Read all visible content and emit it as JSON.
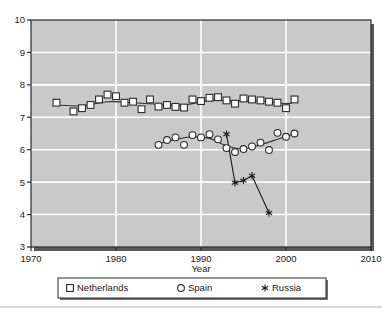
{
  "chart_data": {
    "type": "line",
    "title": "",
    "xlabel": "Year",
    "ylabel": "",
    "xlim": [
      1970,
      2010
    ],
    "ylim": [
      3,
      10
    ],
    "xticks": [
      "1970",
      "1980",
      "1990",
      "2000",
      "2010"
    ],
    "xtick_values": [
      1970,
      1980,
      1990,
      2000,
      2010
    ],
    "yticks": [
      "3",
      "4",
      "5",
      "6",
      "7",
      "8",
      "9",
      "10"
    ],
    "ytick_values": [
      3,
      4,
      5,
      6,
      7,
      8,
      9,
      10
    ],
    "grid": true,
    "grid_color": "#ffffff",
    "plot_bg": "#c9c9c9",
    "legend_position": "below",
    "series": [
      {
        "name": "Netherlands",
        "marker": "square",
        "color": "#333333",
        "x": [
          1973,
          1975,
          1976,
          1977,
          1978,
          1979,
          1980,
          1981,
          1982,
          1983,
          1984,
          1985,
          1986,
          1987,
          1988,
          1989,
          1990,
          1991,
          1992,
          1993,
          1994,
          1995,
          1996,
          1997,
          1998,
          1999,
          2000,
          2001
        ],
        "y": [
          7.45,
          7.18,
          7.28,
          7.38,
          7.55,
          7.7,
          7.65,
          7.45,
          7.48,
          7.25,
          7.55,
          7.33,
          7.38,
          7.32,
          7.3,
          7.55,
          7.5,
          7.6,
          7.62,
          7.52,
          7.42,
          7.58,
          7.55,
          7.52,
          7.48,
          7.45,
          7.28,
          7.55
        ]
      },
      {
        "name": "Spain",
        "marker": "circle",
        "color": "#333333",
        "x": [
          1985,
          1986,
          1987,
          1988,
          1989,
          1990,
          1991,
          1992,
          1993,
          1994,
          1995,
          1996,
          1997,
          1998,
          1999,
          2000,
          2001
        ],
        "y": [
          6.15,
          6.3,
          6.38,
          6.15,
          6.45,
          6.38,
          6.48,
          6.32,
          6.05,
          5.93,
          6.02,
          6.1,
          6.22,
          5.99,
          6.52,
          6.4,
          6.5
        ]
      },
      {
        "name": "Russia",
        "marker": "star",
        "color": "#333333",
        "x": [
          1993,
          1994,
          1995,
          1996,
          1998
        ],
        "y": [
          6.48,
          4.98,
          5.05,
          5.2,
          4.05
        ]
      }
    ],
    "trend_lines": [
      {
        "series": "Netherlands",
        "x": [
          1973,
          1976,
          1979,
          1982,
          1985,
          1988,
          1991,
          1994,
          1997,
          2000,
          2001
        ],
        "y": [
          7.38,
          7.35,
          7.48,
          7.45,
          7.4,
          7.38,
          7.52,
          7.5,
          7.5,
          7.42,
          7.48
        ]
      },
      {
        "series": "Spain",
        "x": [
          1985,
          1987,
          1989,
          1991,
          1993,
          1995,
          1997,
          1999,
          2001
        ],
        "y": [
          6.18,
          6.32,
          6.4,
          6.35,
          6.12,
          6.02,
          6.15,
          6.32,
          6.5
        ]
      }
    ]
  },
  "legend": {
    "items": [
      {
        "label": "Netherlands",
        "marker": "square"
      },
      {
        "label": "Spain",
        "marker": "circle"
      },
      {
        "label": "Russia",
        "marker": "star"
      }
    ]
  },
  "axis": {
    "x_title": "Year"
  }
}
